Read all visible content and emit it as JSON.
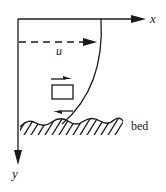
{
  "diagram": {
    "labels": {
      "x_axis": "x",
      "y_axis": "y",
      "velocity": "u",
      "bed": "bed"
    },
    "colors": {
      "stroke": "#1a1a1a",
      "background": "#ffffff"
    },
    "elements": [
      "x-axis arrow",
      "y-axis arrow (downward)",
      "dashed velocity arrow u",
      "velocity profile curve",
      "fluid element square with shear arrows",
      "hatched wavy bed"
    ]
  }
}
